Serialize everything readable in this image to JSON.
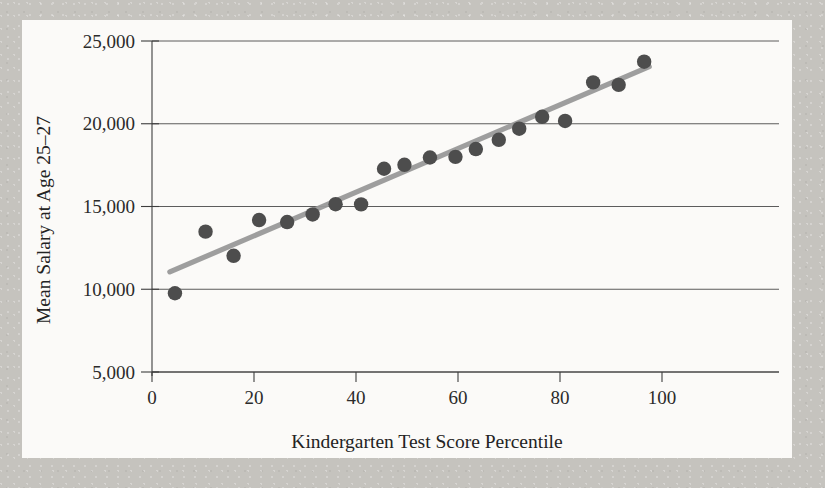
{
  "figure": {
    "background_color": "#fbfaf8",
    "page_color": "#cbc9c4",
    "point_color": "#4d4d4d",
    "trend_color": "#9a9a9a",
    "axis_color": "#3d3d3d"
  },
  "axes": {
    "x_title": "Kindergarten Test Score Percentile",
    "y_title": "Mean Salary at Age 25–27",
    "x_ticks": [
      "0",
      "20",
      "40",
      "60",
      "80",
      "100"
    ],
    "y_ticks": [
      "5,000",
      "10,000",
      "15,000",
      "20,000",
      "25,000"
    ]
  },
  "chart_data": {
    "type": "scatter",
    "title": "",
    "xlabel": "Kindergarten Test Score Percentile",
    "ylabel": "Mean Salary at Age 25–27",
    "xlim": [
      0,
      100
    ],
    "ylim": [
      5000,
      25000
    ],
    "xticks": [
      0,
      20,
      40,
      60,
      80,
      100
    ],
    "yticks": [
      5000,
      10000,
      15000,
      20000,
      25000
    ],
    "grid": "horizontal",
    "legend": null,
    "series": [
      {
        "name": "Mean salary by kindergarten test score percentile",
        "marker": "circle",
        "color": "#4d4d4d",
        "points": [
          {
            "x": 4.5,
            "y": 9760
          },
          {
            "x": 10.5,
            "y": 13480
          },
          {
            "x": 16.0,
            "y": 12020
          },
          {
            "x": 21.0,
            "y": 14180
          },
          {
            "x": 26.5,
            "y": 14060
          },
          {
            "x": 31.5,
            "y": 14520
          },
          {
            "x": 36.0,
            "y": 15140
          },
          {
            "x": 41.0,
            "y": 15130
          },
          {
            "x": 45.5,
            "y": 17280
          },
          {
            "x": 49.5,
            "y": 17520
          },
          {
            "x": 54.5,
            "y": 17960
          },
          {
            "x": 59.5,
            "y": 18000
          },
          {
            "x": 63.5,
            "y": 18470
          },
          {
            "x": 68.0,
            "y": 19030
          },
          {
            "x": 72.0,
            "y": 19700
          },
          {
            "x": 76.5,
            "y": 20420
          },
          {
            "x": 81.0,
            "y": 20170
          },
          {
            "x": 86.5,
            "y": 22500
          },
          {
            "x": 91.5,
            "y": 22350
          },
          {
            "x": 96.5,
            "y": 23750
          }
        ]
      }
    ],
    "trend_line": {
      "type": "linear-fit",
      "color": "#9a9a9a",
      "x_start": 3.5,
      "y_start": 11050,
      "x_end": 97.5,
      "y_end": 23450
    }
  }
}
